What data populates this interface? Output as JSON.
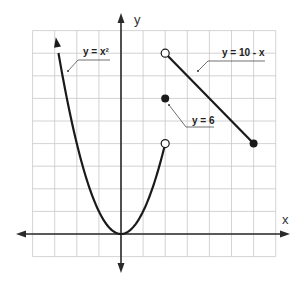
{
  "chart_data": {
    "type": "line",
    "title": "",
    "xlabel": "x",
    "ylabel": "y",
    "xlim": [
      -4,
      7
    ],
    "ylim": [
      -1,
      9
    ],
    "grid": true,
    "grid_step": 1,
    "series": [
      {
        "name": "y = x²",
        "kind": "curve",
        "domain": [
          -2.95,
          2
        ],
        "left_end": "arrow",
        "right_end": {
          "x": 2,
          "y": 4,
          "marker": "open"
        }
      },
      {
        "name": "y = 6",
        "kind": "point",
        "x": 2,
        "y": 6,
        "marker": "filled"
      },
      {
        "name": "y = 10 - x",
        "kind": "segment",
        "points": [
          {
            "x": 2,
            "y": 8,
            "marker": "open"
          },
          {
            "x": 6,
            "y": 4,
            "marker": "filled"
          }
        ]
      }
    ]
  },
  "labels": {
    "x_axis": "x",
    "y_axis": "y",
    "parabola": "y = x²",
    "point": "y = 6",
    "line": "y = 10 - x"
  }
}
